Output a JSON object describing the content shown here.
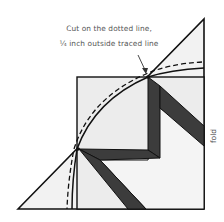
{
  "annotation": {
    "line1": "Cut on the dotted line,",
    "line2": "¼ inch outside traced line"
  },
  "fold_label": "fold",
  "colors": {
    "paper": "#f1f1f1",
    "band": "#3a3a3a",
    "stroke": "#111111",
    "text": "#555555"
  }
}
